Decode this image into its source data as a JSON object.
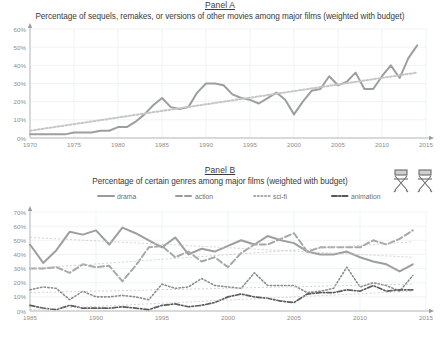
{
  "figure": {
    "background": "#ffffff",
    "icons": [
      {
        "name": "director-chair-icon",
        "label": "director chair"
      },
      {
        "name": "director-chair-icon",
        "label": "director chair"
      }
    ]
  },
  "panel_a": {
    "label": "Panel A",
    "title": "Percentage of sequels, remakes, or versions of other movies among major films (weighted with budget)"
  },
  "panel_b": {
    "label": "Panel B",
    "title": "Percentage of certain genres among major films (weighted with budget)",
    "legend": [
      {
        "label": "drama",
        "style": "solid",
        "color": "#9a9a9a"
      },
      {
        "label": "action",
        "style": "dashed",
        "color": "#9a9a9a"
      },
      {
        "label": "sci-fi",
        "style": "dotted",
        "color": "#8a8a8a"
      },
      {
        "label": "animation",
        "style": "dashdot",
        "color": "#585858"
      }
    ]
  },
  "chart_data": [
    {
      "type": "line",
      "id": "panel-a",
      "title": "Percentage of sequels, remakes, or versions of other movies among major films (weighted with budget)",
      "subtitle": "Panel A",
      "xlabel": "",
      "ylabel": "",
      "xlim": [
        1970,
        2015
      ],
      "ylim": [
        0,
        60
      ],
      "xticks": [
        1970,
        1975,
        1980,
        1985,
        1990,
        1995,
        2000,
        2005,
        2010,
        2015
      ],
      "yticks": [
        0,
        10,
        20,
        30,
        40,
        50,
        60
      ],
      "ytick_labels": [
        "0%",
        "10%",
        "20%",
        "30%",
        "40%",
        "50%",
        "60%"
      ],
      "grid": true,
      "legend": "none",
      "series": [
        {
          "name": "sequels, remakes or versions",
          "style": "solid",
          "color": "#9e9e9e",
          "x": [
            1970,
            1971,
            1972,
            1973,
            1974,
            1975,
            1976,
            1977,
            1978,
            1979,
            1980,
            1981,
            1982,
            1983,
            1984,
            1985,
            1986,
            1987,
            1988,
            1989,
            1990,
            1991,
            1992,
            1993,
            1994,
            1995,
            1996,
            1997,
            1998,
            1999,
            2000,
            2001,
            2002,
            2003,
            2004,
            2005,
            2006,
            2007,
            2008,
            2009,
            2010,
            2011,
            2012,
            2013,
            2014
          ],
          "values": [
            2,
            2,
            2,
            2,
            2,
            3,
            3,
            3,
            4,
            4,
            6,
            6,
            9,
            13,
            18,
            22,
            17,
            16,
            17,
            25,
            30,
            30,
            29,
            24,
            22,
            21,
            19,
            22,
            25,
            21,
            13,
            20,
            26,
            27,
            34,
            29,
            31,
            36,
            27,
            27,
            34,
            40,
            33,
            44,
            51
          ]
        },
        {
          "name": "trend",
          "style": "dotted-trend",
          "color": "#c6c6c6",
          "x": [
            1970,
            2014
          ],
          "values": [
            4,
            36
          ]
        }
      ]
    },
    {
      "type": "line",
      "id": "panel-b",
      "title": "Percentage of certain genres among major films (weighted with budget)",
      "subtitle": "Panel B",
      "xlabel": "",
      "ylabel": "",
      "xlim": [
        1985,
        2015
      ],
      "ylim": [
        0,
        70
      ],
      "xticks": [
        1985,
        1990,
        1995,
        2000,
        2005,
        2010,
        2015
      ],
      "yticks": [
        0,
        10,
        20,
        30,
        40,
        50,
        60,
        70
      ],
      "ytick_labels": [
        "0%",
        "10%",
        "20%",
        "30%",
        "40%",
        "50%",
        "60%",
        "70%"
      ],
      "grid": true,
      "legend": "top",
      "x": [
        1985,
        1986,
        1987,
        1988,
        1989,
        1990,
        1991,
        1992,
        1993,
        1994,
        1995,
        1996,
        1997,
        1998,
        1999,
        2000,
        2001,
        2002,
        2003,
        2004,
        2005,
        2006,
        2007,
        2008,
        2009,
        2010,
        2011,
        2012,
        2013,
        2014
      ],
      "series": [
        {
          "name": "drama",
          "style": "solid",
          "color": "#9e9e9e",
          "values": [
            47,
            34,
            43,
            56,
            54,
            57,
            47,
            59,
            55,
            50,
            45,
            52,
            40,
            44,
            42,
            46,
            50,
            47,
            53,
            50,
            48,
            42,
            40,
            40,
            42,
            38,
            35,
            33,
            28,
            33
          ]
        },
        {
          "name": "action",
          "style": "dashed",
          "color": "#a8a8a8",
          "values": [
            30,
            30,
            31,
            27,
            33,
            31,
            32,
            21,
            32,
            45,
            46,
            38,
            42,
            35,
            38,
            31,
            41,
            47,
            47,
            51,
            55,
            42,
            45,
            45,
            45,
            45,
            50,
            47,
            51,
            57
          ]
        },
        {
          "name": "sci-fi",
          "style": "dotted",
          "color": "#8c8c8c",
          "values": [
            15,
            17,
            16,
            8,
            14,
            10,
            10,
            11,
            10,
            8,
            19,
            16,
            17,
            23,
            18,
            17,
            16,
            27,
            18,
            18,
            18,
            13,
            14,
            16,
            31,
            17,
            20,
            18,
            14,
            25
          ]
        },
        {
          "name": "animation",
          "style": "dashdot",
          "color": "#5c5c5c",
          "values": [
            4,
            2,
            1,
            4,
            2,
            2,
            2,
            3,
            2,
            1,
            4,
            5,
            3,
            4,
            6,
            10,
            12,
            10,
            9,
            7,
            6,
            12,
            13,
            13,
            15,
            14,
            18,
            14,
            15,
            15
          ]
        },
        {
          "name": "drama trend",
          "style": "trend",
          "color": "#c8c8c8",
          "trend_from": [
            1985,
            52
          ],
          "trend_to": [
            2014,
            38
          ]
        },
        {
          "name": "action trend",
          "style": "trend",
          "color": "#c8c8c8",
          "trend_from": [
            1985,
            30
          ],
          "trend_to": [
            2014,
            49
          ]
        },
        {
          "name": "sci-fi trend",
          "style": "trend",
          "color": "#c8c8c8",
          "trend_from": [
            1985,
            13
          ],
          "trend_to": [
            2014,
            19
          ]
        },
        {
          "name": "animation trend",
          "style": "trend",
          "color": "#c8c8c8",
          "trend_from": [
            1985,
            1
          ],
          "trend_to": [
            2014,
            14
          ]
        }
      ]
    }
  ]
}
